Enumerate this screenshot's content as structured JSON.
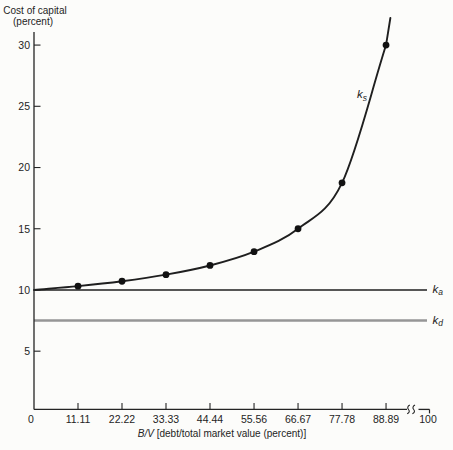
{
  "figure": {
    "y_axis_title_line1": "Cost of capital",
    "y_axis_title_line2": "(percent)",
    "x_axis_title_italic": "B/V",
    "x_axis_title_rest": " [debt/total market value (percent)]"
  },
  "labels": {
    "ks_main": "k",
    "ks_sub": "s",
    "ka_main": "k",
    "ka_sub": "a",
    "kd_main": "k",
    "kd_sub": "d"
  },
  "colors": {
    "background": "#fcfcfa",
    "ink": "#242424",
    "curve": "#1f1f1f",
    "ka_line": "#1f1f1f",
    "kd_line": "#969696"
  },
  "chart_data": {
    "type": "line",
    "title": "",
    "xlabel": "B/V [debt/total market value (percent)]",
    "ylabel": "Cost of capital (percent)",
    "xlim": [
      0,
      100
    ],
    "ylim": [
      0,
      32
    ],
    "grid": false,
    "legend": "inline-right-labels",
    "x_tick_labels": [
      "0",
      "11.11",
      "22.22",
      "33.33",
      "44.44",
      "55.56",
      "66.67",
      "77.78",
      "88.89",
      "100"
    ],
    "x_tick_values": [
      0,
      11.11,
      22.22,
      33.33,
      44.44,
      55.56,
      66.67,
      77.78,
      88.89,
      100
    ],
    "y_ticks": [
      5,
      10,
      15,
      20,
      25,
      30
    ],
    "x_axis_break": {
      "present": true,
      "between": [
        88.89,
        100
      ]
    },
    "series": [
      {
        "name": "ks",
        "label": "k_s",
        "kind": "curve",
        "markers": true,
        "color": "#1f1f1f",
        "x": [
          0,
          11.11,
          22.22,
          33.33,
          44.44,
          55.56,
          66.67,
          77.78,
          88.89
        ],
        "values": [
          10.0,
          10.31,
          10.71,
          11.25,
          12.0,
          13.13,
          15.0,
          18.75,
          30.0
        ]
      },
      {
        "name": "ka",
        "label": "k_a",
        "kind": "hline",
        "markers": false,
        "color": "#1f1f1f",
        "value": 10.0
      },
      {
        "name": "kd",
        "label": "k_d",
        "kind": "hline",
        "markers": false,
        "color": "#969696",
        "value": 7.5
      }
    ]
  }
}
